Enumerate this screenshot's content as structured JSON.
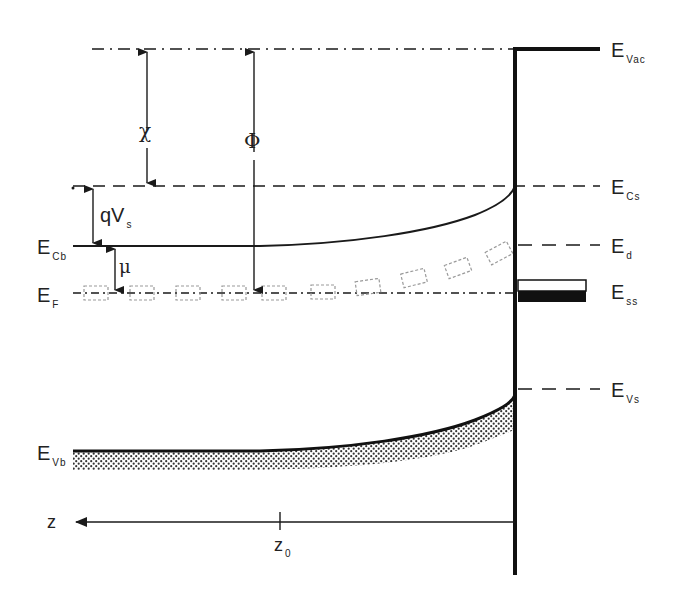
{
  "diagram": {
    "type": "semiconductor-surface-band-diagram",
    "levels": {
      "vacuum": {
        "main": "E",
        "sub": "Vac"
      },
      "conduction_surface": {
        "main": "E",
        "sub": "Cs"
      },
      "conduction_bulk": {
        "main": "E",
        "sub": "Cb"
      },
      "donor": {
        "main": "E",
        "sub": "d"
      },
      "fermi": {
        "main": "E",
        "sub": "F"
      },
      "surface_states": {
        "main": "E",
        "sub": "ss"
      },
      "valence_surface": {
        "main": "E",
        "sub": "Vs"
      },
      "valence_bulk": {
        "main": "E",
        "sub": "Vb"
      }
    },
    "quantities": {
      "electron_affinity": "χ",
      "work_function": "Φ",
      "band_bending": {
        "main": "qV",
        "sub": "s"
      },
      "chemical_potential": "μ"
    },
    "axis": {
      "label": "z",
      "tick": {
        "main": "z",
        "sub": "0"
      }
    },
    "colors": {
      "line": "#1a1a1a",
      "hatch": "#333333",
      "donor_box": "#9a9a9a",
      "background": "#ffffff"
    }
  }
}
